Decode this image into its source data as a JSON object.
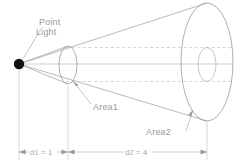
{
  "diagram": {
    "labels": {
      "point_light_line1": "Point",
      "point_light_line2": "Light",
      "area1": "Area1",
      "area2": "Area2"
    },
    "dimensions": {
      "d1": "d1 = 1",
      "d2": "d2 = 4"
    },
    "colors": {
      "background": "#ffffff",
      "ray": "#9c9c9c",
      "outline": "#8e8e8e",
      "dashed": "#bdbdbd",
      "text": "#9a9a9a",
      "light_source": "#111111"
    },
    "geometry": {
      "light_source_x": 19,
      "light_source_y": 64,
      "area1_center_x": 68,
      "area1_center_y": 65,
      "area1_rx": 9,
      "area1_ry": 19,
      "area2_center_x": 207,
      "area2_center_y": 62,
      "area2_rx": 26,
      "area2_ry": 59,
      "projected_area1_rx": 9,
      "projected_area1_ry": 19
    }
  }
}
